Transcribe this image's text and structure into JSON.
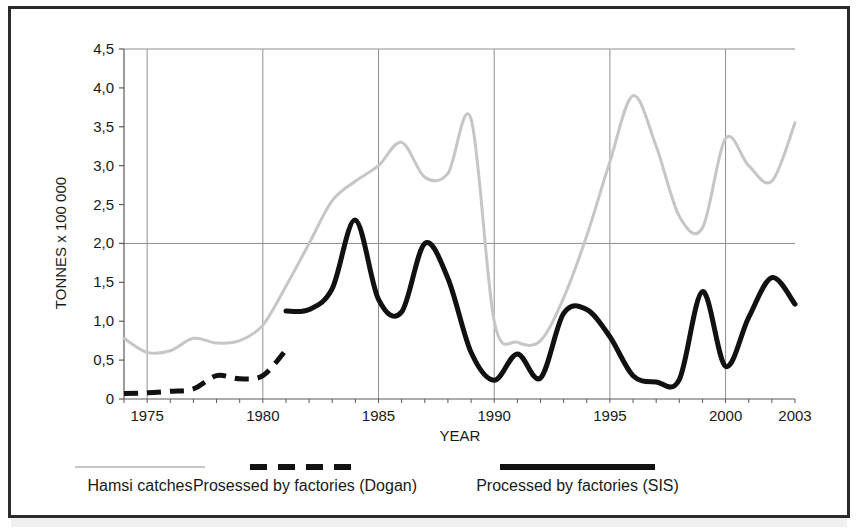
{
  "figure": {
    "background_color": "#ffffff",
    "frame_color": "#2b2b2b"
  },
  "chart_data": {
    "type": "line",
    "title": "",
    "subtitle": "",
    "xlabel": "YEAR",
    "ylabel": "TONNES x 100 000",
    "xlim": [
      1974,
      2003
    ],
    "ylim": [
      0,
      4.5
    ],
    "grid": true,
    "grid_vertical_years": [
      1975,
      1980,
      1985,
      1990,
      1995,
      2000
    ],
    "grid_horizontal_values": [
      2.0,
      4.5
    ],
    "legend_position": "bottom",
    "xticks": [
      1975,
      1980,
      1985,
      1990,
      1995,
      2000,
      2003
    ],
    "xticklabels": [
      "1975",
      "1980",
      "1985",
      "1990",
      "1995",
      "2000",
      "2003"
    ],
    "yticks": [
      0,
      0.5,
      1.0,
      1.5,
      2.0,
      2.5,
      3.0,
      3.5,
      4.0,
      4.5
    ],
    "yticklabels": [
      "0",
      "0,5",
      "1,0",
      "1,5",
      "2,0",
      "2,5",
      "3,0",
      "3,5",
      "4,0",
      "4,5"
    ],
    "x": [
      1974,
      1975,
      1976,
      1977,
      1978,
      1979,
      1980,
      1981,
      1982,
      1983,
      1984,
      1985,
      1986,
      1987,
      1988,
      1989,
      1990,
      1991,
      1992,
      1993,
      1994,
      1995,
      1996,
      1997,
      1998,
      1999,
      2000,
      2001,
      2002,
      2003
    ],
    "series": [
      {
        "name": "Hamsi catches",
        "color": "#c6c6c6",
        "style": "solid",
        "width": 3,
        "x": [
          1974,
          1975,
          1976,
          1977,
          1978,
          1979,
          1980,
          1981,
          1982,
          1983,
          1984,
          1985,
          1986,
          1987,
          1988,
          1989,
          1990,
          1991,
          1992,
          1993,
          1994,
          1995,
          1996,
          1997,
          1998,
          1999,
          2000,
          2001,
          2002,
          2003
        ],
        "values": [
          0.78,
          0.6,
          0.62,
          0.78,
          0.72,
          0.75,
          0.95,
          1.45,
          2.0,
          2.55,
          2.8,
          3.0,
          3.3,
          2.85,
          2.9,
          3.6,
          1.0,
          0.73,
          0.75,
          1.3,
          2.1,
          3.05,
          3.9,
          3.25,
          2.35,
          2.2,
          3.35,
          3.0,
          2.8,
          3.55
        ]
      },
      {
        "name": "Prosessed by factories (Dogan)",
        "color": "#111111",
        "style": "dashed",
        "width": 5,
        "x": [
          1974,
          1975,
          1976,
          1977,
          1978,
          1979,
          1980,
          1981
        ],
        "values": [
          0.07,
          0.08,
          0.1,
          0.13,
          0.3,
          0.26,
          0.3,
          0.63
        ]
      },
      {
        "name": "Processed by factories (SIS)",
        "color": "#111111",
        "style": "solid",
        "width": 5,
        "x": [
          1981,
          1982,
          1983,
          1984,
          1985,
          1986,
          1987,
          1988,
          1989,
          1990,
          1991,
          1992,
          1993,
          1994,
          1995,
          1996,
          1997,
          1998,
          1999,
          2000,
          2001,
          2002,
          2003
        ],
        "values": [
          1.13,
          1.15,
          1.42,
          2.3,
          1.28,
          1.12,
          2.0,
          1.55,
          0.6,
          0.24,
          0.58,
          0.27,
          1.1,
          1.15,
          0.8,
          0.3,
          0.22,
          0.25,
          1.38,
          0.42,
          1.05,
          1.56,
          1.22
        ]
      }
    ],
    "annotations": []
  },
  "legend": {
    "items": [
      {
        "label": "Hamsi catches",
        "marker": "thin-gray-line",
        "color": "#c6c6c6"
      },
      {
        "label": "Prosessed by factories (Dogan)",
        "marker": "thick-black-dashed-line",
        "color": "#111111"
      },
      {
        "label": "Processed by factories (SIS)",
        "marker": "thick-black-solid-line",
        "color": "#111111"
      }
    ]
  }
}
